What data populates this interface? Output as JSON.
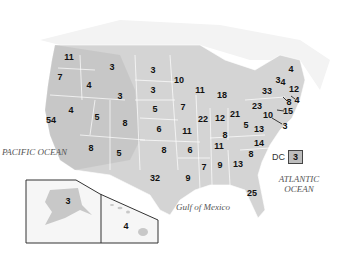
{
  "map": {
    "title": "US Electoral Votes by State",
    "oceans": {
      "pacific": "PACIFIC OCEAN",
      "atlantic": "ATLANTIC OCEAN",
      "gulf": "Gulf of Mexico"
    },
    "dc": {
      "label": "DC",
      "value": "3"
    },
    "states": [
      {
        "state": "WA",
        "value": "11",
        "x": 69,
        "y": 57
      },
      {
        "state": "OR",
        "value": "7",
        "x": 60,
        "y": 77
      },
      {
        "state": "ID",
        "value": "4",
        "x": 89,
        "y": 85
      },
      {
        "state": "MT",
        "value": "3",
        "x": 112,
        "y": 67
      },
      {
        "state": "WY",
        "value": "3",
        "x": 120,
        "y": 96
      },
      {
        "state": "CA",
        "value": "54",
        "x": 51,
        "y": 120
      },
      {
        "state": "NV",
        "value": "4",
        "x": 71,
        "y": 110
      },
      {
        "state": "UT",
        "value": "5",
        "x": 97,
        "y": 117
      },
      {
        "state": "CO",
        "value": "8",
        "x": 125,
        "y": 123
      },
      {
        "state": "AZ",
        "value": "8",
        "x": 91,
        "y": 148
      },
      {
        "state": "NM",
        "value": "5",
        "x": 119,
        "y": 153
      },
      {
        "state": "ND",
        "value": "3",
        "x": 153,
        "y": 70
      },
      {
        "state": "SD",
        "value": "3",
        "x": 153,
        "y": 90
      },
      {
        "state": "NE",
        "value": "5",
        "x": 155,
        "y": 109
      },
      {
        "state": "KS",
        "value": "6",
        "x": 159,
        "y": 129
      },
      {
        "state": "OK",
        "value": "8",
        "x": 164,
        "y": 150
      },
      {
        "state": "TX",
        "value": "32",
        "x": 155,
        "y": 178
      },
      {
        "state": "MN",
        "value": "10",
        "x": 179,
        "y": 80
      },
      {
        "state": "IA",
        "value": "7",
        "x": 183,
        "y": 107
      },
      {
        "state": "MO",
        "value": "11",
        "x": 187,
        "y": 131
      },
      {
        "state": "AR",
        "value": "6",
        "x": 190,
        "y": 150
      },
      {
        "state": "LA",
        "value": "9",
        "x": 188,
        "y": 178
      },
      {
        "state": "WI",
        "value": "11",
        "x": 200,
        "y": 90
      },
      {
        "state": "IL",
        "value": "22",
        "x": 203,
        "y": 119
      },
      {
        "state": "MI",
        "value": "18",
        "x": 222,
        "y": 95
      },
      {
        "state": "IN",
        "value": "12",
        "x": 220,
        "y": 118
      },
      {
        "state": "OH",
        "value": "21",
        "x": 235,
        "y": 114
      },
      {
        "state": "KY",
        "value": "8",
        "x": 225,
        "y": 135
      },
      {
        "state": "TN",
        "value": "11",
        "x": 219,
        "y": 146
      },
      {
        "state": "MS",
        "value": "7",
        "x": 204,
        "y": 167
      },
      {
        "state": "AL",
        "value": "9",
        "x": 220,
        "y": 165
      },
      {
        "state": "GA",
        "value": "13",
        "x": 238,
        "y": 164
      },
      {
        "state": "FL",
        "value": "25",
        "x": 252,
        "y": 193
      },
      {
        "state": "SC",
        "value": "8",
        "x": 251,
        "y": 154
      },
      {
        "state": "NC",
        "value": "14",
        "x": 259,
        "y": 143
      },
      {
        "state": "VA",
        "value": "13",
        "x": 259,
        "y": 129
      },
      {
        "state": "WV",
        "value": "5",
        "x": 246,
        "y": 125
      },
      {
        "state": "PA",
        "value": "23",
        "x": 257,
        "y": 106
      },
      {
        "state": "NY",
        "value": "33",
        "x": 267,
        "y": 91
      },
      {
        "state": "VT",
        "value": "3",
        "x": 278,
        "y": 80
      },
      {
        "state": "NH",
        "value": "4",
        "x": 283,
        "y": 82
      },
      {
        "state": "ME",
        "value": "4",
        "x": 291,
        "y": 69
      },
      {
        "state": "MA",
        "value": "12",
        "x": 294,
        "y": 89
      },
      {
        "state": "RI",
        "value": "4",
        "x": 297,
        "y": 100
      },
      {
        "state": "CT",
        "value": "8",
        "x": 289,
        "y": 102
      },
      {
        "state": "NJ",
        "value": "15",
        "x": 288,
        "y": 111
      },
      {
        "state": "MD",
        "value": "10",
        "x": 268,
        "y": 115
      },
      {
        "state": "DE",
        "value": "3",
        "x": 285,
        "y": 126
      },
      {
        "state": "AK",
        "value": "3",
        "x": 68,
        "y": 201
      },
      {
        "state": "HI",
        "value": "4",
        "x": 126,
        "y": 226
      }
    ]
  }
}
